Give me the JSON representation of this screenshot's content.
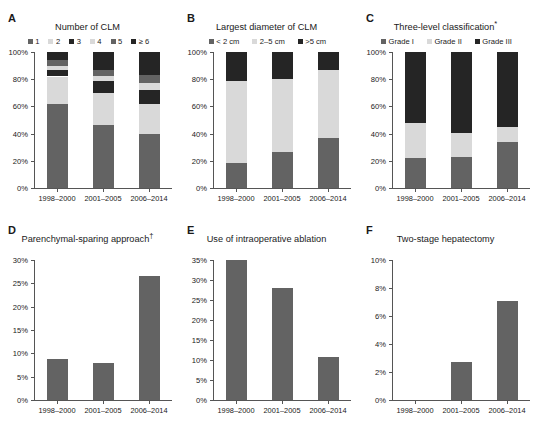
{
  "figure": {
    "categories": [
      "1998–2000",
      "2001–2005",
      "2006–2014"
    ],
    "colors": {
      "dark_gray": "#636363",
      "light_gray": "#d9d9d9",
      "black": "#252525",
      "axis": "#555555",
      "text": "#1a1a1a"
    }
  },
  "panels": [
    {
      "letter": "A",
      "title": "Number of CLM",
      "title_sup": ""
    },
    {
      "letter": "B",
      "title": "Largest diameter of CLM",
      "title_sup": ""
    },
    {
      "letter": "C",
      "title": "Three-level classification",
      "title_sup": "*"
    },
    {
      "letter": "D",
      "title": "Parenchymal-sparing approach",
      "title_sup": "†"
    },
    {
      "letter": "E",
      "title": "Use of intraoperative ablation",
      "title_sup": ""
    },
    {
      "letter": "F",
      "title": "Two-stage hepatectomy",
      "title_sup": ""
    }
  ],
  "chart_data": [
    {
      "panel": "A",
      "type": "bar",
      "subtype": "stacked-percent",
      "title": "Number of CLM",
      "xlabel": "",
      "ylabel": "",
      "ylim": [
        0,
        100
      ],
      "yticks": [
        "0%",
        "20%",
        "40%",
        "60%",
        "80%",
        "100%"
      ],
      "ytick_values": [
        0,
        20,
        40,
        60,
        80,
        100
      ],
      "grid": false,
      "legend_position": "top",
      "categories": [
        "1998–2000",
        "2001–2005",
        "2006–2014"
      ],
      "series": [
        {
          "name": "1",
          "color": "#636363",
          "values": [
            62.0,
            46.5,
            40.0
          ]
        },
        {
          "name": "2",
          "color": "#d9d9d9",
          "values": [
            20.0,
            23.5,
            22.0
          ]
        },
        {
          "name": "3",
          "color": "#252525",
          "values": [
            5.0,
            9.0,
            10.0
          ]
        },
        {
          "name": "4",
          "color": "#d9d9d9",
          "values": [
            2.5,
            3.0,
            5.0
          ]
        },
        {
          "name": "5",
          "color": "#636363",
          "values": [
            4.5,
            5.0,
            6.0
          ]
        },
        {
          "name": "≥ 6",
          "color": "#252525",
          "values": [
            6.0,
            13.0,
            17.0
          ]
        }
      ]
    },
    {
      "panel": "B",
      "type": "bar",
      "subtype": "stacked-percent",
      "title": "Largest diameter of CLM",
      "xlabel": "",
      "ylabel": "",
      "ylim": [
        0,
        100
      ],
      "yticks": [
        "0%",
        "20%",
        "40%",
        "60%",
        "80%",
        "100%"
      ],
      "ytick_values": [
        0,
        20,
        40,
        60,
        80,
        100
      ],
      "grid": false,
      "legend_position": "top",
      "categories": [
        "1998–2000",
        "2001–2005",
        "2006–2014"
      ],
      "series": [
        {
          "name": "< 2 cm",
          "color": "#636363",
          "values": [
            18.5,
            26.5,
            37.0
          ]
        },
        {
          "name": "2–5 cm",
          "color": "#d9d9d9",
          "values": [
            60.5,
            54.0,
            49.5
          ]
        },
        {
          "name": ">5 cm",
          "color": "#252525",
          "values": [
            21.0,
            19.5,
            13.5
          ]
        }
      ]
    },
    {
      "panel": "C",
      "type": "bar",
      "subtype": "stacked-percent",
      "title": "Three-level classification*",
      "xlabel": "",
      "ylabel": "",
      "ylim": [
        0,
        100
      ],
      "yticks": [
        "0%",
        "20%",
        "40%",
        "60%",
        "80%",
        "100%"
      ],
      "ytick_values": [
        0,
        20,
        40,
        60,
        80,
        100
      ],
      "grid": false,
      "legend_position": "top",
      "categories": [
        "1998–2000",
        "2001–2005",
        "2006–2014"
      ],
      "series": [
        {
          "name": "Grade I",
          "color": "#636363",
          "values": [
            22.0,
            22.5,
            33.5
          ]
        },
        {
          "name": "Grade II",
          "color": "#d9d9d9",
          "values": [
            26.0,
            18.0,
            11.5
          ]
        },
        {
          "name": "Grade III",
          "color": "#252525",
          "values": [
            52.0,
            59.5,
            55.0
          ]
        }
      ]
    },
    {
      "panel": "D",
      "type": "bar",
      "subtype": "simple",
      "title": "Parenchymal-sparing approach†",
      "xlabel": "",
      "ylabel": "",
      "ylim": [
        0,
        30
      ],
      "yticks": [
        "0%",
        "5%",
        "10%",
        "15%",
        "20%",
        "25%",
        "30%"
      ],
      "ytick_values": [
        0,
        5,
        10,
        15,
        20,
        25,
        30
      ],
      "grid": false,
      "categories": [
        "1998–2000",
        "2001–2005",
        "2006–2014"
      ],
      "values": [
        8.8,
        8.0,
        26.5
      ],
      "bar_color": "#636363"
    },
    {
      "panel": "E",
      "type": "bar",
      "subtype": "simple",
      "title": "Use of intraoperative ablation",
      "xlabel": "",
      "ylabel": "",
      "ylim": [
        0,
        35
      ],
      "yticks": [
        "0%",
        "5%",
        "10%",
        "15%",
        "20%",
        "25%",
        "30%",
        "35%"
      ],
      "ytick_values": [
        0,
        5,
        10,
        15,
        20,
        25,
        30,
        35
      ],
      "grid": false,
      "categories": [
        "1998–2000",
        "2001–2005",
        "2006–2014"
      ],
      "values": [
        35.0,
        28.0,
        10.8
      ],
      "bar_color": "#636363"
    },
    {
      "panel": "F",
      "type": "bar",
      "subtype": "simple",
      "title": "Two-stage hepatectomy",
      "xlabel": "",
      "ylabel": "",
      "ylim": [
        0,
        10
      ],
      "yticks": [
        "0%",
        "2%",
        "4%",
        "6%",
        "8%",
        "10%"
      ],
      "ytick_values": [
        0,
        2,
        4,
        6,
        8,
        10
      ],
      "grid": false,
      "categories": [
        "1998–2000",
        "2001–2005",
        "2006–2014"
      ],
      "values": [
        0.0,
        2.7,
        7.1
      ],
      "bar_color": "#636363"
    }
  ]
}
